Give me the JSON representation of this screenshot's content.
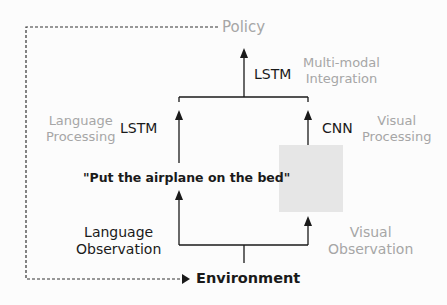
{
  "diagram": {
    "policy": "Policy",
    "environment": "Environment",
    "fusion": {
      "model": "LSTM",
      "label_line1": "Multi-modal",
      "label_line2": "Integration"
    },
    "language_branch": {
      "processing_line1": "Language",
      "processing_line2": "Processing",
      "model": "LSTM",
      "instruction": "\"Put the airplane on the bed\"",
      "observation_line1": "Language",
      "observation_line2": "Observation"
    },
    "visual_branch": {
      "processing_line1": "Visual",
      "processing_line2": "Processing",
      "model": "CNN",
      "image_placeholder": "grey image box",
      "observation_line1": "Visual",
      "observation_line2": "Observation"
    },
    "colors": {
      "line": "#1a1a1a",
      "muted_text": "#a6a6a6",
      "image_box": "#e6e6e6"
    }
  }
}
